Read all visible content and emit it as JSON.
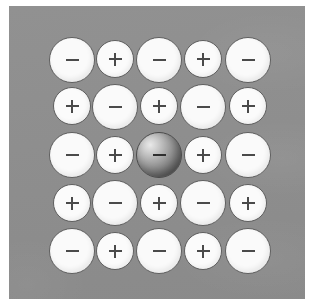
{
  "figure": {
    "title": "Ionic crystal lattice cross-section",
    "panel_color": "#8d8d8d",
    "ion_fill_color": "#fafafa",
    "ion_outline_color": "#5e5e5e",
    "glyph_color": "#4a4a4a",
    "highlight_sphere_color": "#8a8a8a",
    "page_background": "#ffffff"
  },
  "lattice": {
    "rows": 5,
    "columns": 5,
    "anion_label": "−",
    "cation_label": "+",
    "anion_diameter_px": 46,
    "cation_diameter_px": 38,
    "grid": [
      [
        {
          "charge": "anion",
          "label": "−",
          "highlighted": false,
          "cx": 72,
          "cy": 60
        },
        {
          "charge": "cation",
          "label": "+",
          "highlighted": false,
          "cx": 115,
          "cy": 59
        },
        {
          "charge": "anion",
          "label": "−",
          "highlighted": false,
          "cx": 159,
          "cy": 60
        },
        {
          "charge": "cation",
          "label": "+",
          "highlighted": false,
          "cx": 203,
          "cy": 59
        },
        {
          "charge": "anion",
          "label": "−",
          "highlighted": false,
          "cx": 248,
          "cy": 60
        }
      ],
      [
        {
          "charge": "cation",
          "label": "+",
          "highlighted": false,
          "cx": 72,
          "cy": 106
        },
        {
          "charge": "anion",
          "label": "−",
          "highlighted": false,
          "cx": 115,
          "cy": 107
        },
        {
          "charge": "cation",
          "label": "+",
          "highlighted": false,
          "cx": 159,
          "cy": 106
        },
        {
          "charge": "anion",
          "label": "−",
          "highlighted": false,
          "cx": 203,
          "cy": 107
        },
        {
          "charge": "cation",
          "label": "+",
          "highlighted": false,
          "cx": 248,
          "cy": 106
        }
      ],
      [
        {
          "charge": "anion",
          "label": "−",
          "highlighted": false,
          "cx": 72,
          "cy": 155
        },
        {
          "charge": "cation",
          "label": "+",
          "highlighted": false,
          "cx": 115,
          "cy": 155
        },
        {
          "charge": "anion",
          "label": "−",
          "highlighted": true,
          "cx": 159,
          "cy": 155
        },
        {
          "charge": "cation",
          "label": "+",
          "highlighted": false,
          "cx": 203,
          "cy": 155
        },
        {
          "charge": "anion",
          "label": "−",
          "highlighted": false,
          "cx": 248,
          "cy": 155
        }
      ],
      [
        {
          "charge": "cation",
          "label": "+",
          "highlighted": false,
          "cx": 72,
          "cy": 203
        },
        {
          "charge": "anion",
          "label": "−",
          "highlighted": false,
          "cx": 115,
          "cy": 203
        },
        {
          "charge": "cation",
          "label": "+",
          "highlighted": false,
          "cx": 159,
          "cy": 203
        },
        {
          "charge": "anion",
          "label": "−",
          "highlighted": false,
          "cx": 203,
          "cy": 203
        },
        {
          "charge": "cation",
          "label": "+",
          "highlighted": false,
          "cx": 248,
          "cy": 203
        }
      ],
      [
        {
          "charge": "anion",
          "label": "−",
          "highlighted": false,
          "cx": 72,
          "cy": 251
        },
        {
          "charge": "cation",
          "label": "+",
          "highlighted": false,
          "cx": 115,
          "cy": 251
        },
        {
          "charge": "anion",
          "label": "−",
          "highlighted": false,
          "cx": 159,
          "cy": 251
        },
        {
          "charge": "cation",
          "label": "+",
          "highlighted": false,
          "cx": 203,
          "cy": 251
        },
        {
          "charge": "anion",
          "label": "−",
          "highlighted": false,
          "cx": 248,
          "cy": 251
        }
      ]
    ]
  }
}
